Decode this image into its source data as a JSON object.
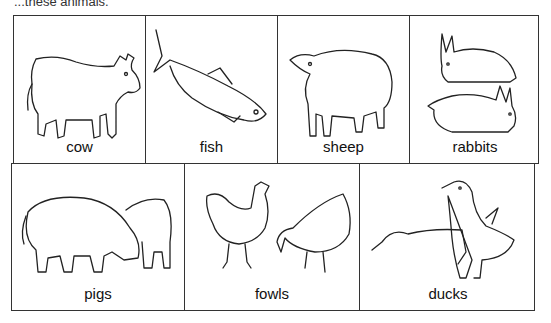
{
  "header": {
    "text": "...these animals."
  },
  "rows": [
    {
      "cells": [
        {
          "label": "cow",
          "icon": "cow-icon"
        },
        {
          "label": "fish",
          "icon": "fish-icon"
        },
        {
          "label": "sheep",
          "icon": "sheep-icon"
        },
        {
          "label": "rabbits",
          "icon": "rabbits-icon"
        }
      ]
    },
    {
      "cells": [
        {
          "label": "pigs",
          "icon": "pigs-icon"
        },
        {
          "label": "fowls",
          "icon": "fowls-icon"
        },
        {
          "label": "ducks",
          "icon": "ducks-icon"
        }
      ]
    }
  ]
}
